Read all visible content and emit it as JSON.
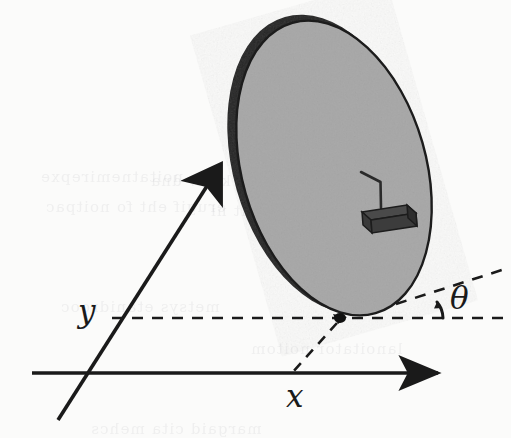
{
  "figure": {
    "kind": "line-diagram",
    "background_color": "#fbfbfa",
    "ink_color": "#1a1a1a",
    "disk_fill_color": "#ababab",
    "disk_rim_color": "#1c1c1c",
    "body_fill_color": "#3c3c3c"
  },
  "labels": {
    "y_axis": "y",
    "x_axis": "x",
    "theta_angle": "θ"
  },
  "axes": {
    "x_axis": {
      "name": "x",
      "from": [
        32,
        373
      ],
      "to": [
        450,
        373
      ],
      "arrow": "end",
      "style": "solid"
    },
    "y_axis": {
      "name": "y",
      "from": [
        58,
        418
      ],
      "to": [
        225,
        158
      ],
      "arrow": "end",
      "style": "solid"
    }
  },
  "disk": {
    "center": [
      332,
      166
    ],
    "radius_x": 92,
    "radius_y": 152,
    "rotation_deg": -16,
    "fill": "#ababab",
    "rim_thickness_px": 9
  },
  "contact_point": {
    "position": [
      340,
      318
    ],
    "radius": 5
  },
  "guides": [
    {
      "name": "horizontal-dashed-guide",
      "from": [
        112,
        318
      ],
      "to": [
        505,
        318
      ],
      "style": "dashed"
    },
    {
      "name": "tilted-dashed-theta-ray",
      "from": [
        398,
        303
      ],
      "to": [
        505,
        268
      ],
      "style": "dashed"
    },
    {
      "name": "contact-to-x-axis-dashed",
      "from": [
        336,
        322
      ],
      "to": [
        292,
        373
      ],
      "style": "dashed"
    }
  ],
  "angle_marker": {
    "name": "theta-arc",
    "vertex": [
      420,
      316
    ],
    "label": "θ",
    "sweep_deg": 18
  },
  "mounted_body": {
    "name": "rotor-block",
    "box_center": [
      386,
      223
    ],
    "box_width": 52,
    "box_height": 14,
    "depth": 10,
    "antenna": {
      "from": [
        381,
        205
      ],
      "elbow": [
        380,
        182
      ],
      "to": [
        362,
        172
      ]
    }
  },
  "ghost_bleed_lines": [
    {
      "text": "noitatnemirepxe",
      "left": 40,
      "top": 168
    },
    {
      "text": "detaler krow dna",
      "left": 150,
      "top": 172
    },
    {
      "text": "erugif eht fo noitpac",
      "left": 45,
      "top": 198
    },
    {
      "text": "noitces txen eht ni",
      "left": 210,
      "top": 202
    },
    {
      "text": "metsys etanidrooc",
      "left": 60,
      "top": 298
    },
    {
      "text": "lanoitator noitom",
      "left": 250,
      "top": 340
    },
    {
      "text": "margaid cita mehcs",
      "left": 90,
      "top": 420
    }
  ]
}
